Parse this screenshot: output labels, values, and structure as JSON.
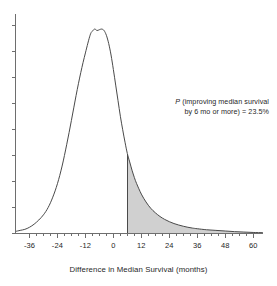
{
  "chart_data": {
    "type": "area",
    "title": "",
    "subtitle": "",
    "xlabel": "Difference in Median Survival (months)",
    "ylabel": "",
    "xlim": [
      -42,
      64
    ],
    "ylim": [
      0,
      1.06
    ],
    "grid": false,
    "legend": null,
    "x_ticks": [
      -36,
      -24,
      -12,
      0,
      12,
      24,
      36,
      48,
      60
    ],
    "x_tick_labels": [
      "-36",
      "-24",
      "-12",
      "0",
      "12",
      "24",
      "36",
      "48",
      "60"
    ],
    "y_ticks": [
      0,
      0.125,
      0.25,
      0.375,
      0.5,
      0.625,
      0.75,
      0.875,
      1.0
    ],
    "y_tick_labels": [
      "",
      "",
      "",
      "",
      "",
      "",
      "",
      "",
      ""
    ],
    "shaded_region": {
      "from_x": 6,
      "to_x": 64,
      "fill_color": "#d0d0d0",
      "edge_color": "#4a4a4a",
      "label": "P (improving median survival by 6 mo or more) = 23.5%"
    },
    "series": [
      {
        "name": "density",
        "x": [
          -42,
          -40,
          -38,
          -36,
          -34,
          -32,
          -30,
          -28,
          -26,
          -24,
          -22,
          -20,
          -18,
          -16,
          -14,
          -12,
          -10,
          -9,
          -8,
          -7,
          -6,
          -5,
          -4,
          -3,
          -2,
          -1,
          0,
          1,
          2,
          3,
          4,
          5,
          6,
          7,
          8,
          9,
          10,
          12,
          14,
          16,
          18,
          20,
          22,
          24,
          26,
          28,
          30,
          32,
          34,
          36,
          40,
          44,
          48,
          52,
          56,
          60,
          64
        ],
        "y": [
          0.01,
          0.015,
          0.02,
          0.03,
          0.045,
          0.065,
          0.09,
          0.125,
          0.175,
          0.24,
          0.325,
          0.43,
          0.545,
          0.665,
          0.775,
          0.87,
          0.955,
          0.975,
          0.985,
          0.978,
          0.982,
          0.985,
          0.978,
          0.955,
          0.915,
          0.86,
          0.79,
          0.715,
          0.64,
          0.565,
          0.5,
          0.44,
          0.385,
          0.345,
          0.305,
          0.27,
          0.24,
          0.19,
          0.152,
          0.122,
          0.1,
          0.082,
          0.068,
          0.057,
          0.048,
          0.041,
          0.035,
          0.03,
          0.026,
          0.023,
          0.018,
          0.015,
          0.012,
          0.009,
          0.007,
          0.005,
          0.004
        ]
      }
    ]
  },
  "axis": {
    "x_title": "Difference in Median Survival (months)",
    "tick_labels": [
      "-36",
      "-24",
      "-12",
      "0",
      "12",
      "24",
      "36",
      "48",
      "60"
    ]
  },
  "annotation": {
    "p_symbol": "P",
    "line1_rest": " (improving median survival",
    "line2": "by 6 mo or more) = 23.5%",
    "full_text": "P (improving median survival by 6 mo or more) = 23.5%",
    "threshold_months": 6,
    "probability_percent": "23.5%"
  },
  "colors": {
    "shade_fill": "#d0d0d0",
    "curve": "#4a4a4a",
    "axis": "#6e6e6e",
    "text": "#1f1f1f",
    "background": "#ffffff"
  }
}
